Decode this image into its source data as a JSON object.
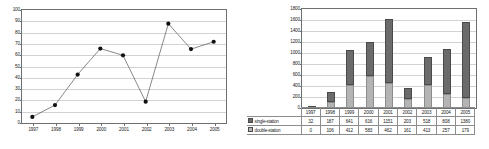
{
  "figure": {
    "caption_fragment": ""
  },
  "left_chart": {
    "icons": {
      "marker": "filled-circle-marker"
    }
  },
  "right_chart": {
    "legend": [
      {
        "key": "single-station",
        "label": "single-station",
        "color": "#6b6b6b",
        "swatch_icon": "square-swatch-icon"
      },
      {
        "key": "double-station",
        "label": "double-station",
        "color": "#b4b4b4",
        "swatch_icon": "square-swatch-icon"
      }
    ]
  },
  "chart_data": [
    {
      "type": "line",
      "title": "",
      "xlabel": "",
      "ylabel": "",
      "x": [
        "1997",
        "1998",
        "1999",
        "2000",
        "2001",
        "2002",
        "2003",
        "2004",
        "2005"
      ],
      "categories": [
        "1997",
        "1998",
        "1999",
        "2000",
        "2001",
        "2002",
        "2003",
        "2004",
        "2005"
      ],
      "values": [
        4.5,
        15,
        42,
        65,
        59,
        18,
        87,
        64.5,
        71
      ],
      "ylim": [
        0,
        100
      ],
      "yticks": [
        0,
        10,
        20,
        30,
        40,
        50,
        60,
        70,
        80,
        90,
        100
      ],
      "ytick_labels": [
        "0",
        "10",
        "20",
        "30",
        "40",
        "50",
        "60",
        "70",
        "80",
        "90",
        "100"
      ],
      "grid": true,
      "markers": true,
      "legend": "none"
    },
    {
      "type": "bar",
      "subtype": "stacked",
      "title": "",
      "xlabel": "",
      "ylabel": "",
      "categories": [
        "1997",
        "1998",
        "1999",
        "2000",
        "2001",
        "2002",
        "2003",
        "2004",
        "2005"
      ],
      "series": [
        {
          "name": "double-station",
          "values": [
            0,
            106,
            412,
            583,
            462,
            161,
            413,
            257,
            179
          ],
          "color": "#b4b4b4",
          "stack_position": "bottom"
        },
        {
          "name": "single-station",
          "values": [
            32,
            187,
            641,
            616,
            1151,
            203,
            518,
            808,
            1380
          ],
          "color": "#6b6b6b",
          "stack_position": "top"
        }
      ],
      "totals": [
        32,
        293,
        1053,
        1199,
        1613,
        364,
        931,
        1065,
        1559
      ],
      "ylim": [
        0,
        1800
      ],
      "yticks": [
        0,
        200,
        400,
        600,
        800,
        1000,
        1200,
        1400,
        1600,
        1800
      ],
      "ytick_labels": [
        "0",
        "200",
        "400",
        "600",
        "800",
        "1000",
        "1200",
        "1400",
        "1600",
        "1800"
      ],
      "grid": true,
      "legend": "data-table-left",
      "data_table": {
        "row_headers": [
          "single-station",
          "double-station"
        ],
        "col_headers": [
          "1997",
          "1998",
          "1999",
          "2000",
          "2001",
          "2002",
          "2003",
          "2004",
          "2005"
        ],
        "rows": [
          [
            "32",
            "187",
            "641",
            "616",
            "1151",
            "203",
            "518",
            "808",
            "1380"
          ],
          [
            "0",
            "106",
            "412",
            "583",
            "462",
            "161",
            "413",
            "257",
            "179"
          ]
        ]
      }
    }
  ]
}
